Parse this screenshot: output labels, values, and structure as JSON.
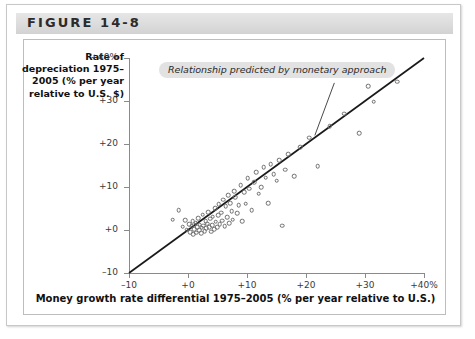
{
  "figure": {
    "title": "FIGURE 14-8"
  },
  "chart_data": {
    "type": "scatter",
    "title": "",
    "xlabel": "Money growth rate differential 1975–2005 (% per year relative to U.S.)",
    "ylabel": "Rate of depreciation 1975–2005 (% per year relative to U.S. $)",
    "xlim": [
      -10,
      40
    ],
    "ylim": [
      -10,
      40
    ],
    "xticks": [
      -10,
      0,
      10,
      20,
      30,
      40
    ],
    "yticks": [
      -10,
      0,
      10,
      20,
      30,
      40
    ],
    "xticklabels": [
      "–10",
      "+0",
      "+10",
      "+20",
      "+30",
      "+40%"
    ],
    "yticklabels": [
      "–10",
      "+0",
      "+10",
      "+20",
      "+30",
      "+40%"
    ],
    "grid": false,
    "legend": null,
    "annotations": [
      {
        "text": "Relationship predicted by monetary approach",
        "x": 6.5,
        "y": 37.0,
        "leader_to_x": 21.5,
        "leader_to_y": 22.0
      }
    ],
    "series": [
      {
        "name": "45-degree line predicted by monetary approach",
        "type": "line",
        "x": [
          -10,
          40
        ],
        "y": [
          -10,
          40
        ],
        "color": "#1a1a1a"
      },
      {
        "name": "Countries",
        "type": "scatter",
        "marker": "open-circle",
        "color": "#6e6e6e",
        "points": [
          [
            -2.6,
            2.4
          ],
          [
            -1.6,
            4.6
          ],
          [
            -0.9,
            0.8
          ],
          [
            -0.5,
            2.3
          ],
          [
            -0.2,
            0.1
          ],
          [
            0.2,
            1.4
          ],
          [
            0.4,
            -0.5
          ],
          [
            0.6,
            0.9
          ],
          [
            0.8,
            2.1
          ],
          [
            0.9,
            -1.0
          ],
          [
            1.1,
            0.2
          ],
          [
            1.3,
            1.7
          ],
          [
            1.4,
            -0.6
          ],
          [
            1.6,
            0.6
          ],
          [
            1.7,
            2.8
          ],
          [
            1.9,
            0.0
          ],
          [
            2.0,
            1.2
          ],
          [
            2.2,
            -0.8
          ],
          [
            2.3,
            0.5
          ],
          [
            2.5,
            3.6
          ],
          [
            2.6,
            1.0
          ],
          [
            2.8,
            -0.3
          ],
          [
            3.0,
            2.0
          ],
          [
            3.1,
            0.4
          ],
          [
            3.3,
            1.5
          ],
          [
            3.4,
            4.2
          ],
          [
            3.6,
            0.7
          ],
          [
            3.8,
            2.6
          ],
          [
            3.9,
            -0.4
          ],
          [
            4.1,
            1.1
          ],
          [
            4.2,
            3.1
          ],
          [
            4.4,
            0.2
          ],
          [
            4.6,
            5.1
          ],
          [
            4.7,
            1.9
          ],
          [
            4.9,
            0.6
          ],
          [
            5.1,
            3.4
          ],
          [
            5.2,
            6.0
          ],
          [
            5.4,
            1.3
          ],
          [
            5.6,
            4.0
          ],
          [
            5.8,
            2.2
          ],
          [
            6.0,
            7.0
          ],
          [
            6.2,
            0.9
          ],
          [
            6.4,
            5.5
          ],
          [
            6.6,
            3.0
          ],
          [
            6.8,
            8.1
          ],
          [
            7.0,
            1.6
          ],
          [
            7.2,
            6.3
          ],
          [
            7.4,
            4.4
          ],
          [
            7.6,
            2.4
          ],
          [
            7.8,
            9.0
          ],
          [
            8.0,
            7.6
          ],
          [
            8.3,
            3.9
          ],
          [
            8.6,
            5.8
          ],
          [
            8.9,
            10.4
          ],
          [
            9.2,
            2.1
          ],
          [
            9.5,
            8.8
          ],
          [
            9.8,
            6.1
          ],
          [
            10.1,
            12.0
          ],
          [
            10.4,
            9.6
          ],
          [
            10.8,
            4.6
          ],
          [
            11.2,
            11.1
          ],
          [
            11.6,
            13.4
          ],
          [
            12.0,
            8.4
          ],
          [
            12.4,
            10.0
          ],
          [
            12.8,
            14.6
          ],
          [
            13.2,
            12.2
          ],
          [
            13.6,
            6.2
          ],
          [
            14.0,
            15.3
          ],
          [
            14.5,
            13.0
          ],
          [
            15.0,
            11.5
          ],
          [
            15.5,
            16.2
          ],
          [
            16.0,
            1.0
          ],
          [
            16.5,
            14.0
          ],
          [
            17.0,
            17.6
          ],
          [
            18.0,
            12.5
          ],
          [
            19.0,
            19.2
          ],
          [
            20.5,
            21.5
          ],
          [
            22.0,
            14.9
          ],
          [
            24.0,
            24.2
          ],
          [
            26.5,
            27.0
          ],
          [
            29.0,
            22.5
          ],
          [
            30.5,
            33.5
          ],
          [
            31.5,
            29.8
          ],
          [
            35.5,
            34.5
          ]
        ]
      }
    ]
  }
}
